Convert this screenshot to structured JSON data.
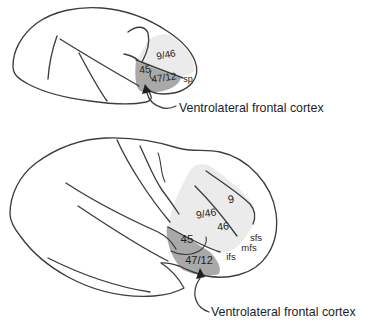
{
  "figure": {
    "colors": {
      "background": "#ffffff",
      "light_region": "#ebebeb",
      "dark_region": "#a9a9a9",
      "outline": "#3d3d3d",
      "label_color": "#1e1e1e"
    },
    "monkey_brain": {
      "area_labels": {
        "a946": "9/46",
        "a45": "45",
        "a4712": "47/12"
      },
      "sulcus_labels": {
        "sp": "sp"
      },
      "caption": "Ventrolateral frontal cortex"
    },
    "human_brain": {
      "area_labels": {
        "a9": "9",
        "a946": "9/46",
        "a46": "46",
        "a45": "45",
        "a4712": "47/12"
      },
      "sulcus_labels": {
        "sfs": "sfs",
        "mfs": "mfs",
        "ifs": "ifs"
      },
      "caption": "Ventrolateral frontal cortex"
    }
  }
}
